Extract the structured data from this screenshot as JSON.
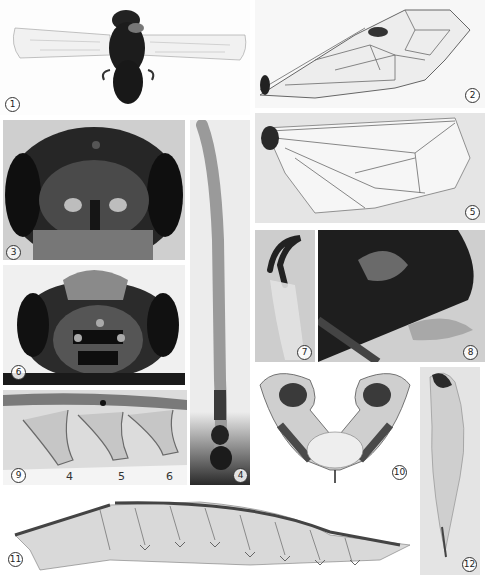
{
  "figure": {
    "type": "scientific-plate",
    "panels": [
      {
        "id": 1,
        "label": "1",
        "content": "habitus, dorsal view with spread wings"
      },
      {
        "id": 2,
        "label": "2",
        "content": "fore wing"
      },
      {
        "id": 3,
        "label": "3",
        "content": "head, frontal view"
      },
      {
        "id": 4,
        "label": "4",
        "content": "antenna"
      },
      {
        "id": 5,
        "label": "5",
        "content": "hind wing"
      },
      {
        "id": 6,
        "label": "6",
        "content": "head, dorsal view"
      },
      {
        "id": 7,
        "label": "7",
        "content": "tarsal claw"
      },
      {
        "id": 8,
        "label": "8",
        "content": "apex of abdomen, lateral view"
      },
      {
        "id": 9,
        "label": "9",
        "content": "lancet segments detail",
        "segment_numbers": [
          "4",
          "5",
          "6"
        ]
      },
      {
        "id": 10,
        "label": "10",
        "content": "male genital capsule"
      },
      {
        "id": 11,
        "label": "11",
        "content": "lancet"
      },
      {
        "id": 12,
        "label": "12",
        "content": "penis valve"
      }
    ]
  },
  "colors": {
    "background": "#ffffff",
    "panel_light": "#e9e9e9",
    "panel_dark": "#2a2a2a",
    "specimen_dark": "#1a1a1a",
    "vein": "#5a5a5a"
  }
}
